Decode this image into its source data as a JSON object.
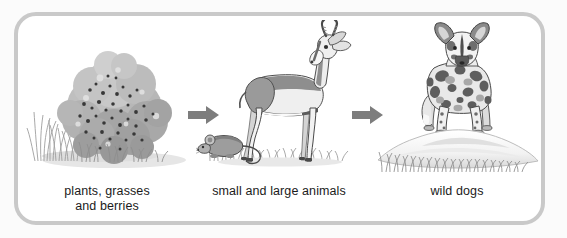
{
  "figure": {
    "name": "food-chain-diagram",
    "type": "flow",
    "background_color": "#fbfbfb",
    "frame_color": "#c9c9c9",
    "panel_count": 3,
    "arrow_count": 2
  },
  "panels": [
    {
      "id": "producers",
      "caption_lines": [
        "plants, grasses",
        "and berries"
      ],
      "illustration": "berry-bush-with-grass",
      "subjects": [
        "berry bush",
        "grass tufts",
        "berries"
      ]
    },
    {
      "id": "consumers",
      "caption_lines": [
        "small and large animals"
      ],
      "illustration": "gazelle-and-mouse-on-grass",
      "subjects": [
        "gazelle",
        "mouse",
        "grass"
      ]
    },
    {
      "id": "predators",
      "caption_lines": [
        "wild dogs"
      ],
      "illustration": "wild-dog-on-mound",
      "subjects": [
        "african wild dog",
        "mound",
        "grass"
      ]
    }
  ],
  "arrows": [
    {
      "id": "arrow-one",
      "direction": "right",
      "color": "#7d7d7d"
    },
    {
      "id": "arrow-two",
      "direction": "right",
      "color": "#7d7d7d"
    }
  ],
  "colors": {
    "text": "#1b1b1b",
    "arrow": "#7d7d7d",
    "frame": "#c9c9c9",
    "bush_light": "#c6c6c6",
    "bush_mid": "#ababab",
    "bush_dark": "#8f8f8f",
    "berry": "#3a3a3a",
    "animal_light": "#ededed",
    "animal_mid": "#a8a8a8",
    "animal_dark": "#6b6b6b",
    "animal_outline": "#4a4a4a",
    "grass": "#9a9a9a",
    "ground": "#e2e2e2",
    "mound": "#fdfdfd",
    "mound_shade": "#dcdcdc"
  }
}
